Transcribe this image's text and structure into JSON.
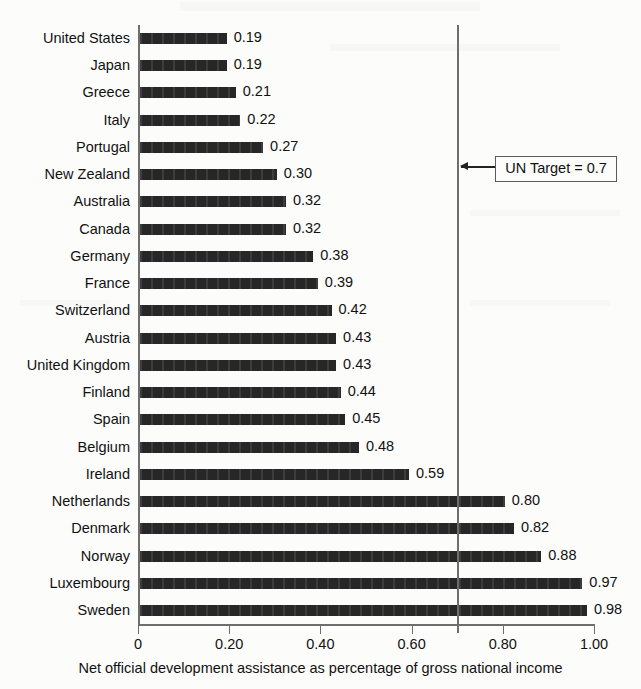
{
  "chart_data": {
    "type": "bar",
    "orientation": "horizontal",
    "title": "",
    "xlabel": "Net official development assistance as percentage of gross national income",
    "ylabel": "",
    "xlim": [
      0,
      1.0
    ],
    "xticks": [
      "0",
      "0.20",
      "0.40",
      "0.60",
      "0.80",
      "1.00"
    ],
    "xtick_values": [
      0,
      0.2,
      0.4,
      0.6,
      0.8,
      1.0
    ],
    "grid": false,
    "legend": "none",
    "categories": [
      "United States",
      "Japan",
      "Greece",
      "Italy",
      "Portugal",
      "New Zealand",
      "Australia",
      "Canada",
      "Germany",
      "France",
      "Switzerland",
      "Austria",
      "United Kingdom",
      "Finland",
      "Spain",
      "Belgium",
      "Ireland",
      "Netherlands",
      "Denmark",
      "Norway",
      "Luxembourg",
      "Sweden"
    ],
    "values": [
      0.19,
      0.19,
      0.21,
      0.22,
      0.27,
      0.3,
      0.32,
      0.32,
      0.38,
      0.39,
      0.42,
      0.43,
      0.43,
      0.44,
      0.45,
      0.48,
      0.59,
      0.8,
      0.82,
      0.88,
      0.97,
      0.98
    ],
    "value_labels": [
      "0.19",
      "0.19",
      "0.21",
      "0.22",
      "0.27",
      "0.30",
      "0.32",
      "0.32",
      "0.38",
      "0.39",
      "0.42",
      "0.43",
      "0.43",
      "0.44",
      "0.45",
      "0.48",
      "0.59",
      "0.80",
      "0.82",
      "0.88",
      "0.97",
      "0.98"
    ],
    "annotations": [
      {
        "name": "un-target",
        "label": "UN Target = 0.7",
        "value": 0.7,
        "kind": "vertical-reference-line-with-callout"
      }
    ],
    "colors": {
      "bar": "#1a1a1a",
      "axis": "#6e6e6e",
      "text": "#111111",
      "background": "#fcfcfb",
      "annotation_border": "#5a5a5a"
    }
  }
}
